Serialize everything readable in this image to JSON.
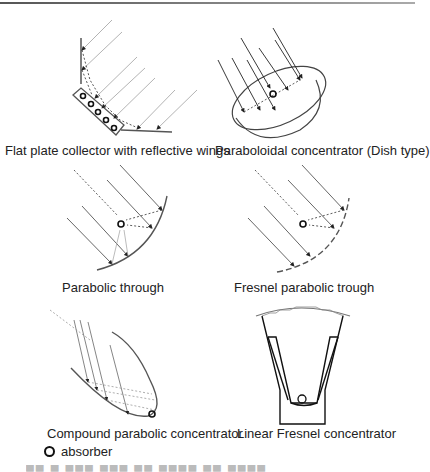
{
  "figure": {
    "panels": [
      {
        "id": "flat-plate",
        "caption": "Flat plate collector with reflective wings"
      },
      {
        "id": "dish",
        "caption": "Paraboloidal concentrator (Dish type)"
      },
      {
        "id": "parabolic-trough",
        "caption": "Parabolic through"
      },
      {
        "id": "fresnel-trough",
        "caption": "Fresnel parabolic trough"
      },
      {
        "id": "cpc",
        "caption": "Compound parabolic concentrator"
      },
      {
        "id": "linear-fresnel",
        "caption": "Linear Fresnel concentrator"
      }
    ],
    "legend": {
      "symbol": "absorber-ring-icon",
      "label": "absorber"
    },
    "cutoff_caption": "Fig. 4 ..."
  }
}
